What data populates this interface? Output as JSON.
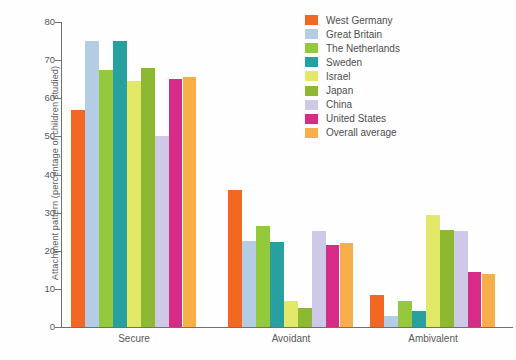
{
  "chart_data": {
    "type": "bar",
    "title": "",
    "xlabel": "",
    "ylabel": "Attachment pattern (percentage of children studied)",
    "ylim": [
      0,
      80
    ],
    "yticks": [
      0,
      10,
      20,
      30,
      40,
      50,
      60,
      70,
      80
    ],
    "grid": false,
    "legend_position": "top-right",
    "categories": [
      "Secure",
      "Avoidant",
      "Ambivalent"
    ],
    "series": [
      {
        "name": "West Germany",
        "color": "#f26722",
        "values": [
          57.0,
          36.0,
          8.5
        ]
      },
      {
        "name": "Great Britain",
        "color": "#b4cde4",
        "values": [
          75.0,
          22.5,
          3.0
        ]
      },
      {
        "name": "The Netherlands",
        "color": "#95c93d",
        "values": [
          67.5,
          26.5,
          6.7
        ]
      },
      {
        "name": "Sweden",
        "color": "#29a0a0",
        "values": [
          75.0,
          22.3,
          4.2
        ]
      },
      {
        "name": "Israel",
        "color": "#e2e868",
        "values": [
          64.5,
          6.8,
          29.3
        ]
      },
      {
        "name": "Japan",
        "color": "#8cb832",
        "values": [
          68.0,
          5.0,
          25.5
        ]
      },
      {
        "name": "China",
        "color": "#cdc9e6",
        "values": [
          50.0,
          25.3,
          25.3
        ]
      },
      {
        "name": "United States",
        "color": "#d62b87",
        "values": [
          65.0,
          21.5,
          14.3
        ]
      },
      {
        "name": "Overall average",
        "color": "#f9ae49",
        "values": [
          65.5,
          22.0,
          14.0
        ]
      }
    ]
  },
  "axes": {
    "y_label": "Attachment pattern (percentage of children studied)",
    "y_ticks": [
      "0",
      "10",
      "20",
      "30",
      "40",
      "50",
      "60",
      "70",
      "80"
    ],
    "x_ticks": [
      "Secure",
      "Avoidant",
      "Ambivalent"
    ]
  },
  "legend": {
    "items": [
      {
        "label": "West Germany",
        "color": "#f26722"
      },
      {
        "label": "Great Britain",
        "color": "#b4cde4"
      },
      {
        "label": "The Netherlands",
        "color": "#95c93d"
      },
      {
        "label": "Sweden",
        "color": "#29a0a0"
      },
      {
        "label": "Israel",
        "color": "#e2e868"
      },
      {
        "label": "Japan",
        "color": "#8cb832"
      },
      {
        "label": "China",
        "color": "#cdc9e6"
      },
      {
        "label": "United States",
        "color": "#d62b87"
      },
      {
        "label": "Overall average",
        "color": "#f9ae49"
      }
    ]
  }
}
